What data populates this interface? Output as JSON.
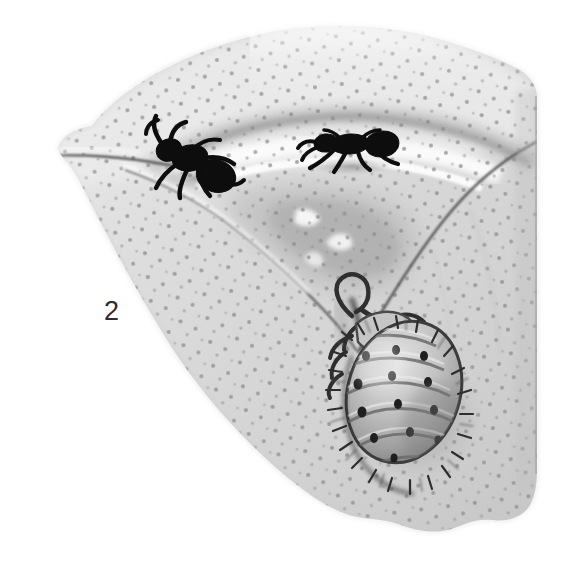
{
  "figure": {
    "number": "2",
    "medium": "halftone wash drawing",
    "background_color": "#ffffff"
  },
  "palette": {
    "paper": "#ffffff",
    "stem_light": "#e6e6e6",
    "stem_mid": "#d5d5d5",
    "stem_shade": "#bdbdbd",
    "stem_deep_shade": "#a3a3a3",
    "speck": "#8a8a8a",
    "crack_line": "#4a4a4a",
    "ant_body": "#111111",
    "aphid_body": "#b9b9b9",
    "aphid_outline": "#3a3a3a",
    "caption_text": "#2e2e2e",
    "highlight": "#fbfbfb"
  },
  "subjects": [
    {
      "id": "ant-left",
      "label": "ant-left",
      "species_role": "attending ant",
      "pose": "rearing, forelegs and antennae raised",
      "facing": "left",
      "position": {
        "x": 190,
        "y": 152
      },
      "size": {
        "w": 78,
        "h": 62
      },
      "color": "#111111"
    },
    {
      "id": "ant-right",
      "label": "ant-right",
      "species_role": "attending ant",
      "pose": "walking in profile",
      "facing": "left",
      "position": {
        "x": 350,
        "y": 148
      },
      "size": {
        "w": 86,
        "h": 34
      },
      "color": "#111111"
    },
    {
      "id": "aphid",
      "label": "woolly-aphid",
      "species_role": "aphid tended by ants",
      "pose": "clinging head-up, abdomen pendant",
      "facing": "down-right",
      "position": {
        "x": 400,
        "y": 380
      },
      "size": {
        "w": 110,
        "h": 180
      },
      "color": "#b9b9b9",
      "features": [
        "segmented abdomen",
        "marginal hairs",
        "row of dark spiracle dots",
        "legs gripping stem",
        "curved antenna loop"
      ]
    }
  ],
  "substrate": {
    "name": "plant stem surface",
    "texture": "fine stippled speckles in regular rows",
    "features": [
      "broad pale band across the top",
      "dark curved ridge beneath the upper band",
      "white highlight trough where the right ant walks",
      "V-shaped cleft descending to the aphid",
      "straight cut edge on the right",
      "torn irregular lower margin",
      "soft faded left and top margins"
    ]
  },
  "annotations": {
    "caption_position": {
      "x": 104,
      "y": 298
    }
  }
}
